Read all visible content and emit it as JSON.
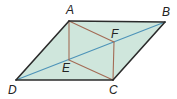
{
  "diagram": {
    "type": "parallelogram",
    "colors": {
      "fill": "#cfe6dc",
      "edge": "#2b2b2b",
      "inner_lines": "#a36b55",
      "diagonal": "#4d93b8",
      "label": "#222222"
    },
    "points": {
      "A": {
        "x": 69,
        "y": 21,
        "label": "A",
        "lx": 66,
        "ly": 14
      },
      "B": {
        "x": 165,
        "y": 22,
        "label": "B",
        "lx": 162,
        "ly": 16
      },
      "C": {
        "x": 113,
        "y": 80,
        "label": "C",
        "lx": 109,
        "ly": 94
      },
      "D": {
        "x": 16,
        "y": 80,
        "label": "D",
        "lx": 8,
        "ly": 94
      },
      "E": {
        "x": 69,
        "y": 60,
        "label": "E",
        "lx": 62,
        "ly": 72
      },
      "F": {
        "x": 114,
        "y": 42,
        "label": "F",
        "lx": 111,
        "ly": 38
      }
    },
    "segments": [
      {
        "from": "A",
        "to": "B",
        "role": "edge"
      },
      {
        "from": "B",
        "to": "C",
        "role": "edge"
      },
      {
        "from": "C",
        "to": "D",
        "role": "edge"
      },
      {
        "from": "D",
        "to": "A",
        "role": "edge"
      },
      {
        "from": "D",
        "to": "B",
        "role": "diagonal"
      },
      {
        "from": "A",
        "to": "E",
        "role": "inner"
      },
      {
        "from": "A",
        "to": "F",
        "role": "inner"
      },
      {
        "from": "F",
        "to": "C",
        "role": "inner"
      },
      {
        "from": "E",
        "to": "C",
        "role": "inner"
      }
    ]
  }
}
